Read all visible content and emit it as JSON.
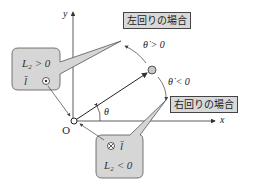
{
  "axes": {
    "x_label": "x",
    "y_label": "y",
    "origin_label": "O",
    "angle_label": "θ"
  },
  "labels": {
    "ccw_box": "左回りの場合",
    "cw_box": "右回りの場合",
    "theta_dot_positive": "θ̇ > 0",
    "theta_dot_negative": "θ̇ < 0"
  },
  "callout_upper": {
    "line1": "L₂ > 0",
    "line2_symbol": "l̄",
    "line2_icon": "out-of-page-dot"
  },
  "callout_lower": {
    "line1_icon": "into-page-cross",
    "line1_symbol": "l̄",
    "line2": "L₂ < 0"
  },
  "colors": {
    "callout_fill": "#d6d6d6",
    "callout_stroke": "#555555",
    "axis": "#333333",
    "ball_fill": "#c8c8c8"
  }
}
